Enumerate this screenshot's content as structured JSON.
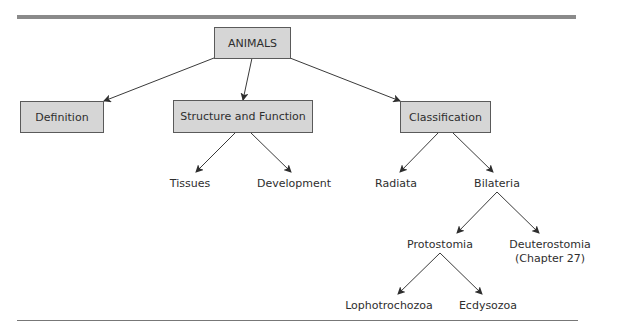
{
  "diagram": {
    "root": {
      "label": "ANIMALS"
    },
    "level1": [
      {
        "id": "definition",
        "label": "Definition"
      },
      {
        "id": "structure",
        "label": "Structure and Function"
      },
      {
        "id": "classification",
        "label": "Classification"
      }
    ],
    "structure_children": [
      {
        "label": "Tissues"
      },
      {
        "label": "Development"
      }
    ],
    "classification_children": [
      {
        "label": "Radiata"
      },
      {
        "label": "Bilateria"
      }
    ],
    "bilateria_children": [
      {
        "label": "Protostomia"
      },
      {
        "label": "Deuterostomia",
        "note": "(Chapter 27)"
      }
    ],
    "protostomia_children": [
      {
        "label": "Lophotrochozoa"
      },
      {
        "label": "Ecdysozoa"
      }
    ]
  },
  "colors": {
    "box_fill": "#d6d6d6",
    "box_border": "#5a5a5a",
    "text": "#2e2e2e",
    "top_rule": "#8a8a8a"
  }
}
